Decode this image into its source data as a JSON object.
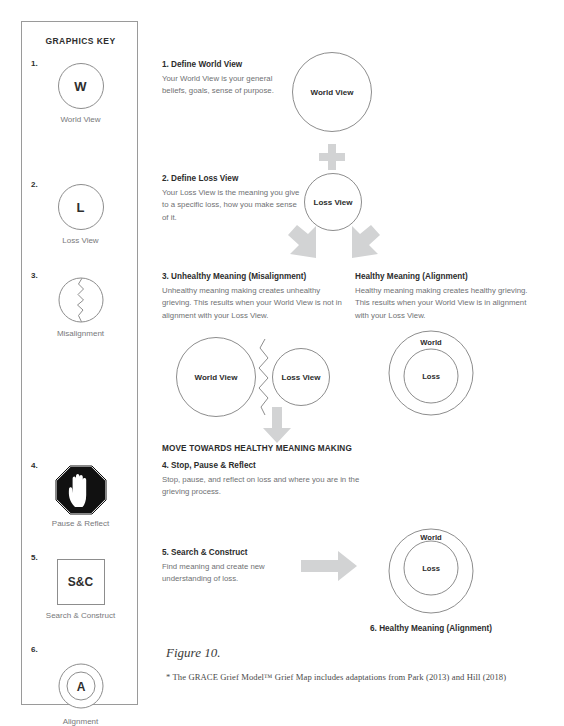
{
  "key_panel": {
    "title": "GRAPHICS KEY",
    "items": [
      {
        "num": "1.",
        "glyph": "W",
        "icon": "circle-letter-icon",
        "label": "World View"
      },
      {
        "num": "2.",
        "glyph": "L",
        "icon": "circle-letter-icon",
        "label": "Loss View"
      },
      {
        "num": "3.",
        "glyph": "",
        "icon": "cracked-circle-icon",
        "label": "Misalignment"
      },
      {
        "num": "4.",
        "glyph": "",
        "icon": "stop-hand-octagon-icon",
        "label": "Pause & Reflect"
      },
      {
        "num": "5.",
        "glyph": "S&C",
        "icon": "square-label-icon",
        "label": "Search & Construct"
      },
      {
        "num": "6.",
        "glyph": "A",
        "icon": "concentric-circle-icon",
        "label": "Alignment"
      }
    ]
  },
  "steps": {
    "step1": {
      "heading": "1. Define World View",
      "body": "Your World View is your general beliefs, goals, sense of purpose.",
      "bubble": "World View"
    },
    "step2": {
      "heading": "2. Define Loss View",
      "body": "Your Loss View is the meaning you give to a specific loss, how you make sense of it.",
      "bubble": "Loss View"
    },
    "step3_left": {
      "heading": "3. Unhealthy Meaning (Misalignment)",
      "body": "Unhealthy meaning making creates unhealthy grieving. This results when your World View is not in alignment with your Loss View.",
      "bubble_large": "World View",
      "bubble_small": "Loss View"
    },
    "step3_right": {
      "heading": "Healthy Meaning (Alignment)",
      "body": "Healthy meaning making creates healthy grieving. This results when your World View is in alignment with your Loss View.",
      "ring_outer": "World",
      "ring_inner": "Loss"
    },
    "banner": "MOVE TOWARDS HEALTHY MEANING MAKING",
    "step4": {
      "heading": "4. Stop, Pause & Reflect",
      "body": "Stop, pause, and reflect on loss and where you are in the grieving process."
    },
    "step5": {
      "heading": "5. Search & Construct",
      "body": "Find meaning and create new understanding of loss."
    },
    "step6": {
      "heading": "6. Healthy Meaning (Alignment)",
      "ring_outer": "World",
      "ring_inner": "Loss"
    }
  },
  "figure": {
    "caption": "Figure 10.",
    "footnote": "* The GRACE Grief Model™ Grief Map includes adaptations from Park (2013) and Hill (2018)"
  },
  "colors": {
    "arrow_gray": "#d2d3d4",
    "stroke_gray": "#8d8d8d",
    "body_text": "#6f7173",
    "heading_text": "#2c2c2c"
  }
}
